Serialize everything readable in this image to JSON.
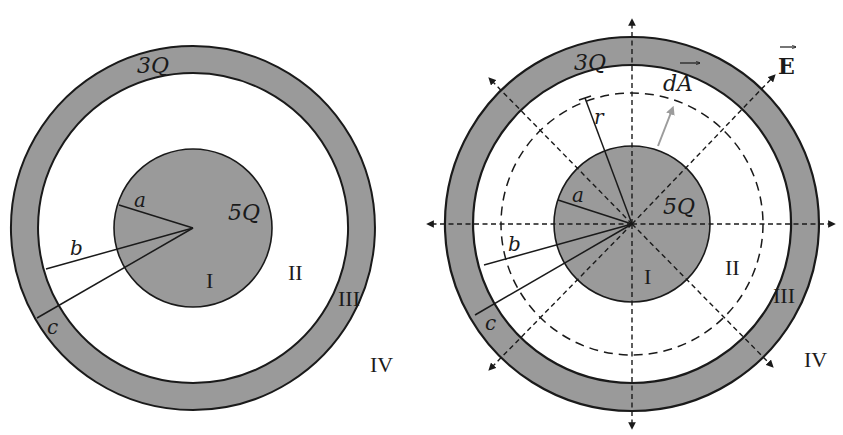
{
  "colors": {
    "fill": "#9a9a9a",
    "stroke": "#1a1a1a",
    "background": "#ffffff",
    "area_vector": "#9c9c9c"
  },
  "left_diagram": {
    "shell_charge": "3Q",
    "core_charge": "5Q",
    "radius_labels": {
      "a": "a",
      "b": "b",
      "c": "c"
    },
    "regions": [
      "I",
      "II",
      "III",
      "IV"
    ]
  },
  "right_diagram": {
    "shell_charge": "3Q",
    "core_charge": "5Q",
    "radius_labels": {
      "a": "a",
      "b": "b",
      "c": "c",
      "r": "r"
    },
    "regions": [
      "I",
      "II",
      "III",
      "IV"
    ],
    "field_label": "E",
    "area_label": "dA",
    "field_arrow_count": 8
  }
}
